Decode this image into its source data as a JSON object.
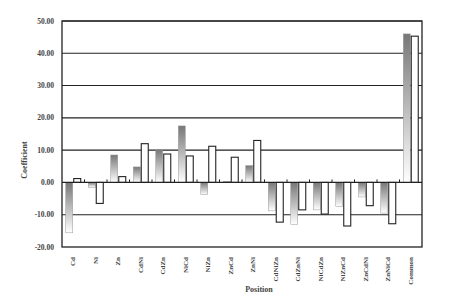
{
  "chart_data": {
    "type": "bar",
    "title": "",
    "xlabel": "Position",
    "ylabel": "Coefficient",
    "ylim": [
      -20,
      50
    ],
    "yticks": [
      "50.00",
      "40.00",
      "30.00",
      "20.00",
      "10.00",
      "0.00",
      "-10.00",
      "-20.00"
    ],
    "grid": true,
    "legend": null,
    "categories": [
      "Cd",
      "Ni",
      "Zn",
      "CdNi",
      "CdZn",
      "NiCd",
      "NiZn",
      "ZnCd",
      "ZnNi",
      "CdNiZn",
      "CdZnNi",
      "NiCdZn",
      "NiZnCd",
      "ZnCdNi",
      "ZnNiCd",
      "Common"
    ],
    "series": [
      {
        "name": "Series 1 (gradient)",
        "values": [
          -15.6,
          -1.5,
          8.5,
          4.8,
          10.2,
          17.5,
          -3.8,
          0.3,
          5.2,
          -8.8,
          -13.0,
          -8.5,
          -7.5,
          -4.5,
          -9.5,
          46.0
        ]
      },
      {
        "name": "Series 2 (white)",
        "values": [
          1.2,
          -6.5,
          1.8,
          12.0,
          8.8,
          8.2,
          11.2,
          7.8,
          13.0,
          -12.3,
          -8.5,
          -9.8,
          -13.5,
          -7.2,
          -12.8,
          45.3
        ]
      }
    ]
  }
}
